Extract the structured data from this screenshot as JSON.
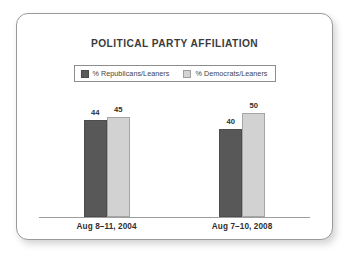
{
  "card": {
    "border_color": "#9a9a9a",
    "background": "#ffffff"
  },
  "chart_data": {
    "type": "bar",
    "title": "POLITICAL PARTY AFFILIATION",
    "xlabel": "",
    "ylabel": "",
    "ylim": [
      0,
      52
    ],
    "grid": false,
    "legend_position": "top-center",
    "categories": [
      "Aug 8–11, 2004",
      "Aug 7–10, 2008"
    ],
    "series": [
      {
        "name": "% Republicans/Leaners",
        "color": "#585858",
        "values": [
          44,
          40
        ]
      },
      {
        "name": "% Democrats/Leaners",
        "color": "#d2d2d2",
        "values": [
          45,
          50
        ]
      }
    ],
    "bar_labels": [
      [
        "44",
        "45"
      ],
      [
        "40",
        "50"
      ]
    ]
  }
}
